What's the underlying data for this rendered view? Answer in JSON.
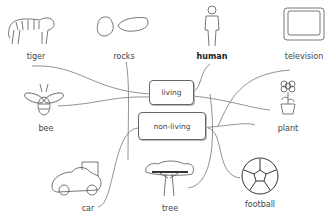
{
  "diagram": {
    "type": "mind-map",
    "center_nodes": [
      {
        "id": "living",
        "label": "living"
      },
      {
        "id": "non-living",
        "label": "non-living"
      }
    ],
    "items": [
      {
        "id": "tiger",
        "label": "tiger",
        "category": "living",
        "icon": "tiger-icon"
      },
      {
        "id": "rocks",
        "label": "rocks",
        "category": "non-living",
        "icon": "rocks-icon"
      },
      {
        "id": "human",
        "label": "human",
        "category": "living",
        "icon": "human-icon"
      },
      {
        "id": "television",
        "label": "television",
        "category": "non-living",
        "icon": "television-icon"
      },
      {
        "id": "bee",
        "label": "bee",
        "category": "living",
        "icon": "bee-icon"
      },
      {
        "id": "plant",
        "label": "plant",
        "category": "living",
        "icon": "plant-icon"
      },
      {
        "id": "car",
        "label": "car",
        "category": "non-living",
        "icon": "car-icon"
      },
      {
        "id": "tree",
        "label": "tree",
        "category": "living",
        "icon": "tree-icon"
      },
      {
        "id": "football",
        "label": "football",
        "category": "non-living",
        "icon": "football-icon"
      }
    ]
  }
}
